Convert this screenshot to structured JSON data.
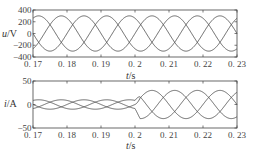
{
  "chart_data": [
    {
      "type": "line",
      "title": "",
      "xlabel": "t/s",
      "ylabel": "u/V",
      "xlim": [
        0.17,
        0.23
      ],
      "ylim": [
        -400,
        400
      ],
      "xticks": [
        "0.17",
        "0.18",
        "0.19",
        "0.2",
        "0.21",
        "0.22",
        "0.23"
      ],
      "yticks": [
        "400",
        "200",
        "0",
        "-200",
        "-400"
      ],
      "grid": false,
      "series": [
        {
          "name": "u_a",
          "description": "three-phase sinusoidal voltage, amplitude ~300 V, 50 Hz",
          "amplitude": 300,
          "frequency_hz": 50,
          "phase_deg": 0
        },
        {
          "name": "u_b",
          "amplitude": 300,
          "frequency_hz": 50,
          "phase_deg": -120
        },
        {
          "name": "u_c",
          "amplitude": 300,
          "frequency_hz": 50,
          "phase_deg": 120
        }
      ]
    },
    {
      "type": "line",
      "title": "",
      "xlabel": "t/s",
      "ylabel": "i/A",
      "xlim": [
        0.17,
        0.23
      ],
      "ylim": [
        -50,
        50
      ],
      "xticks": [
        "0.17",
        "0.18",
        "0.19",
        "0.2",
        "0.21",
        "0.22",
        "0.23"
      ],
      "yticks": [
        "50",
        "0",
        "-50"
      ],
      "grid": false,
      "annotations": [
        "step change in current amplitude at t = 0.2 s"
      ],
      "series": [
        {
          "name": "i_a",
          "amplitude_before": 10,
          "amplitude_after": 30,
          "step_time": 0.2,
          "frequency_hz": 50,
          "phase_deg": 0
        },
        {
          "name": "i_b",
          "amplitude_before": 10,
          "amplitude_after": 30,
          "step_time": 0.2,
          "frequency_hz": 50,
          "phase_deg": -120
        },
        {
          "name": "i_c",
          "amplitude_before": 10,
          "amplitude_after": 30,
          "step_time": 0.2,
          "frequency_hz": 50,
          "phase_deg": 120
        }
      ]
    }
  ],
  "labels": {
    "top_ylabel_u": "u",
    "top_ylabel_unit": "/V",
    "bottom_ylabel_i": "i",
    "bottom_ylabel_unit": "/A",
    "xlabel_t": "t",
    "xlabel_unit": "/s"
  },
  "colors": {
    "line": "#555555",
    "axis": "#333333",
    "text": "#444444"
  }
}
